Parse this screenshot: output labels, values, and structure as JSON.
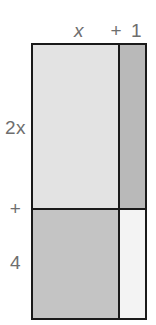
{
  "figure": {
    "type": "area-model",
    "top_labels": [
      {
        "id": "x",
        "text": "x",
        "style": "italic"
      },
      {
        "id": "plus-one",
        "text": "+ 1",
        "style": "normal"
      }
    ],
    "left_labels": [
      {
        "id": "two-x",
        "text": "2x",
        "style": "normal"
      },
      {
        "id": "plus",
        "text": "+",
        "style": "normal"
      },
      {
        "id": "four",
        "text": "4",
        "style": "normal"
      }
    ],
    "regions": [
      {
        "id": "top-left",
        "row": "2x",
        "column": "x",
        "fill": "#e3e3e3"
      },
      {
        "id": "top-right",
        "row": "2x",
        "column": "+ 1",
        "fill": "#b9b9b9"
      },
      {
        "id": "bottom-left",
        "row": "4",
        "column": "x",
        "fill": "#c4c4c4"
      },
      {
        "id": "bottom-right",
        "row": "4",
        "column": "+ 1",
        "fill": "#f3f3f3"
      }
    ],
    "colors": {
      "border": "#1a1a1a",
      "label": "#6e6e6e",
      "background": "#ffffff"
    }
  }
}
